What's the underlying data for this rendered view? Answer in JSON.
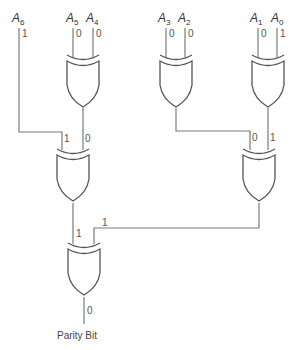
{
  "diagram": {
    "gate_type": "XOR",
    "inputs": [
      {
        "name": "A",
        "sub": "6",
        "value": "1"
      },
      {
        "name": "A",
        "sub": "5",
        "value": "0"
      },
      {
        "name": "A",
        "sub": "4",
        "value": "0"
      },
      {
        "name": "A",
        "sub": "3",
        "value": "0"
      },
      {
        "name": "A",
        "sub": "2",
        "value": "0"
      },
      {
        "name": "A",
        "sub": "1",
        "value": "0"
      },
      {
        "name": "A",
        "sub": "0",
        "value": "1"
      }
    ],
    "gates": [
      {
        "id": "xor-a5-a4",
        "inputs": [
          "A5",
          "A4"
        ],
        "output": "0"
      },
      {
        "id": "xor-a3-a2",
        "inputs": [
          "A3",
          "A2"
        ],
        "output": "0"
      },
      {
        "id": "xor-a1-a0",
        "inputs": [
          "A1",
          "A0"
        ],
        "output": "1"
      },
      {
        "id": "xor-a6-g1",
        "input_values": [
          "1",
          "0"
        ],
        "output": "1"
      },
      {
        "id": "xor-g2-g3",
        "input_values": [
          "0",
          "1"
        ],
        "output": "1"
      },
      {
        "id": "xor-final",
        "input_values": [
          "1",
          "1"
        ],
        "output": "0"
      }
    ],
    "wire_labels": {
      "g4_in_left": "1",
      "g4_in_right": "0",
      "g5_in_left": "0",
      "g5_in_right": "1",
      "g6_in_left": "1",
      "g6_in_right": "1",
      "final_out": "0"
    },
    "output_label": "Parity Bit"
  }
}
